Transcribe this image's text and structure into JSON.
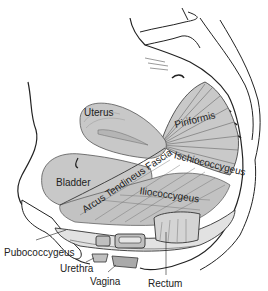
{
  "diagram": {
    "colors": {
      "organ_fill": "#c8c8c8",
      "organ_fill_light": "#d8d8d8",
      "outline": "#222222",
      "muscle_fill": "#bdbdbd",
      "background": "#ffffff"
    },
    "labels": {
      "uterus": "Uterus",
      "bladder": "Bladder",
      "piriformis": "Piriformis",
      "ischiococcygeus": "Ischiococcygeus",
      "arcus_tendineus_fascia": "Arcus Tendineus Fascia",
      "iliococcygeus": "Iliococcygeus",
      "pubococcygeus": "Pubococcygeus",
      "urethra": "Urethra",
      "vagina": "Vagina",
      "rectum": "Rectum"
    }
  }
}
